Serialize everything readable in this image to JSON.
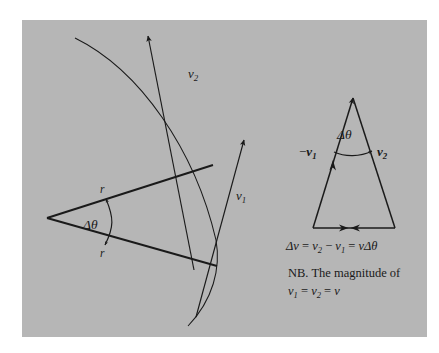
{
  "figure": {
    "panel_background_color": "#b6b6b6",
    "ink_color": "#1a1a1a",
    "page_background_color": "#ffffff",
    "left_diagram": {
      "name": "circular-motion-arc-diagram",
      "radius_label_upper": "r",
      "radius_label_lower": "r",
      "angle_label": "Δθ",
      "velocity_label_1_var": "v",
      "velocity_label_1_sub": "1",
      "velocity_label_2_var": "v",
      "velocity_label_2_sub": "2"
    },
    "right_diagram": {
      "name": "velocity-difference-triangle",
      "angle_label": "Δθ",
      "left_side_label_sign": "−",
      "left_side_label_var": "v",
      "left_side_label_sub": "1",
      "right_side_label_var": "v",
      "right_side_label_sub": "2",
      "equation": {
        "delta_v": "Δv",
        "equals_1": " = ",
        "term_v2_var": "v",
        "term_v2_sub": "2",
        "minus": " − ",
        "term_v1_var": "v",
        "term_v1_sub": "1",
        "equals_2": " = ",
        "result_var": "v",
        "result_delta_theta": "Δθ"
      },
      "note_line_1": "NB. The magnitude of",
      "note_line_2": {
        "v1_var": "v",
        "v1_sub": "1",
        "equals_1": " = ",
        "v2_var": "v",
        "v2_sub": "2",
        "equals_2": " = ",
        "v_var": "v"
      }
    }
  }
}
